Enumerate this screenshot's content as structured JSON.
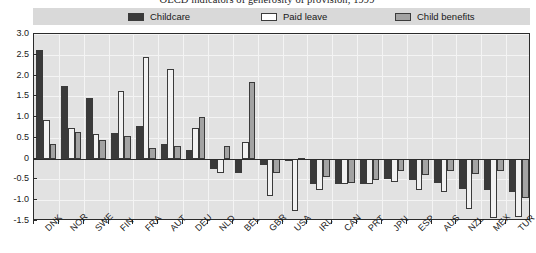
{
  "chart_data": {
    "type": "bar",
    "title": "OECD indicators of generosity of provision, 1999",
    "xlabel": "",
    "ylabel": "",
    "ylim": [
      -1.5,
      3.0
    ],
    "yticks": [
      "3.0",
      "2.5",
      "2.0",
      "1.5",
      "1.0",
      "0.5",
      "0",
      "-0.5",
      "-1.0",
      "-1.5"
    ],
    "ytick_values": [
      3.0,
      2.5,
      2.0,
      1.5,
      1.0,
      0.5,
      0,
      -0.5,
      -1.0,
      -1.5
    ],
    "grid": true,
    "legend_position": "top",
    "categories": [
      "DNK",
      "NOR",
      "SWE",
      "FIN",
      "FRA",
      "AUT",
      "DEU",
      "NLD",
      "BEL",
      "GBR",
      "USA",
      "IRL",
      "CAN",
      "PRT",
      "JPN",
      "ESP",
      "AUS",
      "NZL",
      "MEX",
      "TUR"
    ],
    "series": [
      {
        "name": "Childcare",
        "color": "#3a3a3a",
        "values": [
          2.62,
          1.75,
          1.45,
          0.62,
          0.78,
          0.35,
          0.2,
          -0.25,
          -0.35,
          -0.15,
          -0.05,
          -0.6,
          -0.62,
          -0.62,
          -0.5,
          -0.52,
          -0.58,
          -0.72,
          -0.75,
          -0.8
        ]
      },
      {
        "name": "Paid leave",
        "color": "#f2f2f2",
        "values": [
          0.92,
          0.75,
          0.6,
          1.62,
          2.45,
          2.15,
          0.75,
          -0.35,
          0.4,
          -0.9,
          -1.25,
          -0.75,
          -0.62,
          -0.62,
          -0.55,
          -0.75,
          -0.8,
          -1.22,
          -1.42,
          -1.4
        ]
      },
      {
        "name": "Child benefits",
        "color": "#a3a3a3",
        "values": [
          0.35,
          0.65,
          0.45,
          0.55,
          0.25,
          0.3,
          1.0,
          0.3,
          1.85,
          -0.35,
          0.02,
          -0.45,
          -0.58,
          -0.52,
          -0.3,
          -0.4,
          -0.3,
          -0.38,
          -0.3,
          -0.95
        ]
      }
    ]
  }
}
